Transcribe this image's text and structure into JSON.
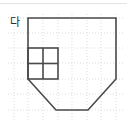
{
  "figure": {
    "label": "다",
    "label_position": {
      "x": 10,
      "y": 26
    },
    "colors": {
      "outline": "#4a4a4a",
      "inner_grid": "#4a4a4a",
      "background_grid": "#dcdcdc",
      "page_background": "#ffffff",
      "top_rule": "#e3e3e3",
      "label_text": "#2b2b2b"
    },
    "outline": {
      "name": "plot-outline",
      "shape": "pentagon",
      "points": "28,18 116,18 116,79 88,110 56,110 28,79",
      "stroke_width": 1.6
    },
    "unit_square_grid": {
      "name": "unit-square-grid",
      "rows": 2,
      "cols": 2,
      "x": 28,
      "y": 48,
      "width": 30,
      "height": 31,
      "stroke_width": 1.6
    },
    "background_grid": {
      "vertical_lines_x": [
        14,
        28,
        43,
        58,
        72,
        87,
        101,
        116
      ],
      "horizontal_lines_y": [
        18,
        33,
        48,
        63,
        79,
        94,
        110
      ],
      "stroke_width": 1,
      "dash": "1 2"
    }
  }
}
